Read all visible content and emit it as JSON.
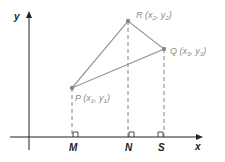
{
  "diagram": {
    "type": "coordinate-geometry",
    "axes": {
      "x_label": "x",
      "y_label": "y"
    },
    "points": [
      {
        "name": "P",
        "coords_label": "(x1, y1)",
        "foot": "M"
      },
      {
        "name": "R",
        "coords_label": "(x2, y2)",
        "foot": "N"
      },
      {
        "name": "Q",
        "coords_label": "(x3, y3)",
        "foot": "S"
      }
    ],
    "feet": [
      "M",
      "N",
      "S"
    ],
    "triangle": [
      "P",
      "R",
      "Q"
    ],
    "colors": {
      "axis": "#222222",
      "triangle": "#999999",
      "point": "#888888",
      "label": "#8a8a8a"
    }
  }
}
